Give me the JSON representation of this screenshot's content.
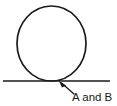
{
  "diagram": {
    "type": "geometry-figure",
    "background_color": "#ffffff",
    "stroke_color": "#1a1a1a",
    "text_color": "#1a1a1a",
    "circle": {
      "name": "circle",
      "center_x": 51.5,
      "center_y": 43.5,
      "radius_x": 34.5,
      "radius_y": 37.5,
      "stroke_width": 1.7
    },
    "tangent_line": {
      "name": "horizontal-line",
      "x1": 3,
      "y1": 81,
      "x2": 110,
      "y2": 81,
      "stroke_width": 1.7
    },
    "tangent_point": {
      "x": 51.5,
      "y": 81
    },
    "pointer": {
      "name": "arrow",
      "tail_x": 74,
      "tail_y": 94,
      "tip_x": 59,
      "tip_y": 82,
      "stroke_width": 1.3
    },
    "label": {
      "text": "A and B",
      "x": 72,
      "y": 101
    }
  }
}
